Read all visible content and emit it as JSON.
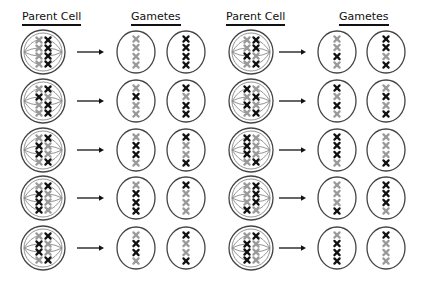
{
  "headers": {
    "left_parent": "Parent Cell",
    "left_gametes": "Gametes",
    "right_parent": "Parent Cell",
    "right_gametes": "Gametes"
  },
  "colors": {
    "black_chromosome": "#111111",
    "gray_chromosome": "#9a9a9a",
    "outline": "#444444"
  },
  "legend_note": "Each row: parent cell with 4 homologous chromosome pairs aligned at metaphase (left column / right column) -> two gametes",
  "panels": [
    {
      "name": "left",
      "rows": [
        {
          "parent_left": [
            "G",
            "G",
            "G",
            "G"
          ],
          "parent_right": [
            "B",
            "B",
            "B",
            "B"
          ],
          "gamete1": [
            "G",
            "G",
            "G",
            "G"
          ],
          "gamete2": [
            "B",
            "B",
            "B",
            "B"
          ]
        },
        {
          "parent_left": [
            "G",
            "B",
            "G",
            "G"
          ],
          "parent_right": [
            "B",
            "G",
            "B",
            "B"
          ],
          "gamete1": [
            "G",
            "B",
            "G",
            "G"
          ],
          "gamete2": [
            "B",
            "G",
            "B",
            "B"
          ]
        },
        {
          "parent_left": [
            "G",
            "B",
            "B",
            "G"
          ],
          "parent_right": [
            "B",
            "G",
            "G",
            "B"
          ],
          "gamete1": [
            "G",
            "B",
            "B",
            "G"
          ],
          "gamete2": [
            "B",
            "G",
            "G",
            "B"
          ]
        },
        {
          "parent_left": [
            "G",
            "B",
            "B",
            "B"
          ],
          "parent_right": [
            "B",
            "G",
            "G",
            "G"
          ],
          "gamete1": [
            "G",
            "B",
            "B",
            "B"
          ],
          "gamete2": [
            "B",
            "G",
            "G",
            "G"
          ]
        },
        {
          "parent_left": [
            "G",
            "B",
            "B",
            "G"
          ],
          "parent_right": [
            "B",
            "G",
            "G",
            "B"
          ],
          "gamete1": [
            "G",
            "B",
            "B",
            "G"
          ],
          "gamete2": [
            "B",
            "G",
            "G",
            "B"
          ]
        }
      ]
    },
    {
      "name": "right",
      "rows": [
        {
          "parent_left": [
            "G",
            "G",
            "B",
            "G"
          ],
          "parent_right": [
            "B",
            "B",
            "G",
            "B"
          ],
          "gamete1": [
            "G",
            "G",
            "B",
            "G"
          ],
          "gamete2": [
            "B",
            "B",
            "G",
            "B"
          ]
        },
        {
          "parent_left": [
            "B",
            "G",
            "B",
            "G"
          ],
          "parent_right": [
            "G",
            "B",
            "G",
            "B"
          ],
          "gamete1": [
            "B",
            "G",
            "B",
            "G"
          ],
          "gamete2": [
            "G",
            "B",
            "G",
            "B"
          ]
        },
        {
          "parent_left": [
            "B",
            "B",
            "B",
            "G"
          ],
          "parent_right": [
            "G",
            "G",
            "G",
            "B"
          ],
          "gamete1": [
            "B",
            "B",
            "B",
            "G"
          ],
          "gamete2": [
            "G",
            "G",
            "G",
            "B"
          ]
        },
        {
          "parent_left": [
            "G",
            "G",
            "G",
            "B"
          ],
          "parent_right": [
            "B",
            "B",
            "B",
            "G"
          ],
          "gamete1": [
            "G",
            "G",
            "G",
            "B"
          ],
          "gamete2": [
            "B",
            "B",
            "B",
            "G"
          ]
        },
        {
          "parent_left": [
            "G",
            "B",
            "B",
            "B"
          ],
          "parent_right": [
            "B",
            "G",
            "G",
            "G"
          ],
          "gamete1": [
            "G",
            "B",
            "B",
            "B"
          ],
          "gamete2": [
            "B",
            "G",
            "G",
            "G"
          ]
        }
      ]
    }
  ],
  "layout": {
    "row_centers_y": [
      52,
      101,
      150,
      198,
      248
    ],
    "panel_x": [
      {
        "parent": 43,
        "arrow_start": 77,
        "arrow_end": 104,
        "gamete1": 136,
        "gamete2": 186
      },
      {
        "parent": 251,
        "arrow_start": 279,
        "arrow_end": 306,
        "gamete1": 337,
        "gamete2": 386
      }
    ]
  }
}
